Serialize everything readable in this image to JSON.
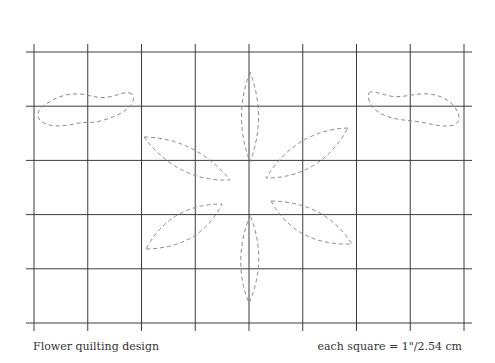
{
  "title": "Flower quilting design",
  "scale_note": "each square = 1\"/2.54 cm",
  "grid": {
    "columns": 8,
    "rows": 5,
    "square_size_in": 1,
    "square_size_cm": 2.54
  },
  "motifs": {
    "flower": {
      "petal_count": 6,
      "line_style": "dashed"
    },
    "leaves": {
      "count": 2,
      "line_style": "dashed"
    }
  },
  "colors": {
    "grid": "#3c3c3c",
    "stitch": "#8a8a8a",
    "background": "#ffffff"
  }
}
